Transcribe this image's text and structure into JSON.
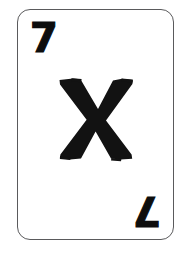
{
  "card": {
    "type": "alphabet-flashcard",
    "background_color": "#ffffff",
    "border_color": "#5a5a5c",
    "ink_color": "#121212",
    "corner_radius_px": 13,
    "rank_top_left": "7",
    "rank_bottom_right": "7",
    "center_letter": "X",
    "center_letter_style": "bold-rough-brush"
  },
  "icons": {
    "letter_x": "letter-x-icon",
    "numeral_seven": "numeral-seven-icon"
  }
}
